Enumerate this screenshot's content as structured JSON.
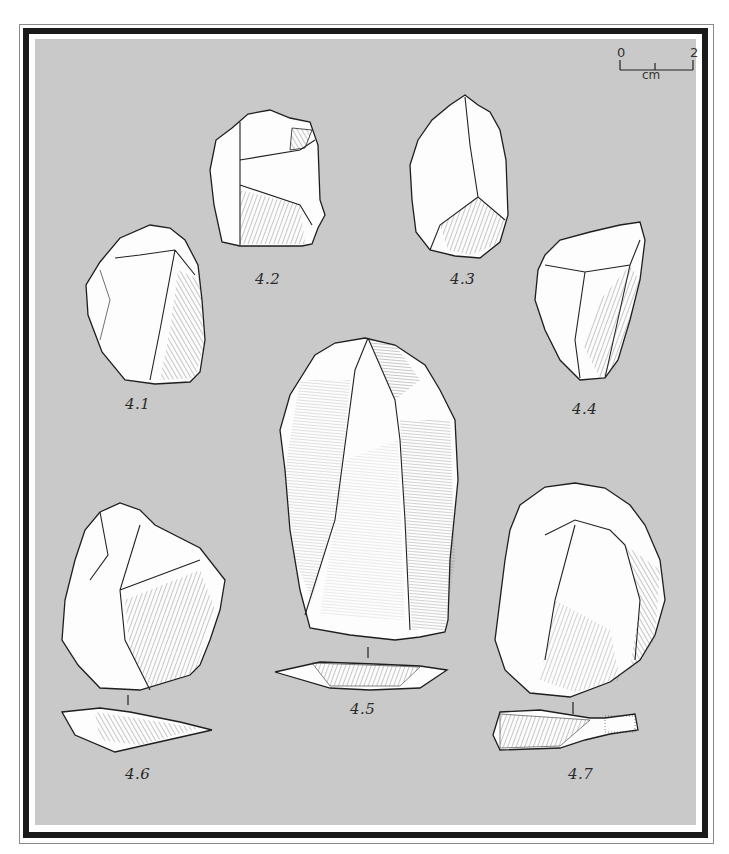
{
  "plate": {
    "background_color": "#c9c9c9",
    "frame_color": "#1a1a1a"
  },
  "scale_bar": {
    "start": "0",
    "end": "2",
    "unit": "cm"
  },
  "figures": [
    {
      "id": "4.1",
      "label": "4.1"
    },
    {
      "id": "4.2",
      "label": "4.2"
    },
    {
      "id": "4.3",
      "label": "4.3"
    },
    {
      "id": "4.4",
      "label": "4.4"
    },
    {
      "id": "4.5",
      "label": "4.5"
    },
    {
      "id": "4.6",
      "label": "4.6"
    },
    {
      "id": "4.7",
      "label": "4.7"
    }
  ]
}
